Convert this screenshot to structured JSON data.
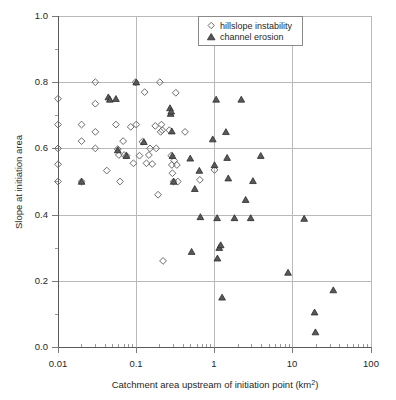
{
  "chart_data": {
    "type": "scatter",
    "title": "",
    "xlabel": "Catchment area upstream of initiation point (km2)",
    "xlabel_main": "Catchment area upstream of initiation point (km",
    "xlabel_sup": "2",
    "xlabel_tail": ")",
    "ylabel": "Slope at initiation area",
    "xscale": "log",
    "yscale": "linear",
    "xlim": [
      0.01,
      100
    ],
    "ylim": [
      0.0,
      1.0
    ],
    "xticks": [
      0.01,
      0.1,
      1,
      10,
      100
    ],
    "xticklabels": [
      "0.01",
      "0.1",
      "1",
      "10",
      "100"
    ],
    "yticks": [
      0.0,
      0.2,
      0.4,
      0.6,
      0.8,
      1.0
    ],
    "yticklabels": [
      "0.0",
      "0.2",
      "0.4",
      "0.6",
      "0.8",
      "1.0"
    ],
    "yticks_minor": [
      0.1,
      0.3,
      0.5,
      0.7,
      0.9
    ],
    "grid": true,
    "grid_color": "#b9b9b9",
    "legend_position": "top-center",
    "series": [
      {
        "name": "hillslope instability",
        "marker": "diamond",
        "color": "#6b6b6b",
        "points": [
          [
            0.01,
            0.75
          ],
          [
            0.01,
            0.672
          ],
          [
            0.01,
            0.6
          ],
          [
            0.01,
            0.552
          ],
          [
            0.01,
            0.5
          ],
          [
            0.02,
            0.672
          ],
          [
            0.02,
            0.622
          ],
          [
            0.02,
            0.5
          ],
          [
            0.03,
            0.8
          ],
          [
            0.03,
            0.735
          ],
          [
            0.03,
            0.65
          ],
          [
            0.03,
            0.6
          ],
          [
            0.042,
            0.533
          ],
          [
            0.055,
            0.672
          ],
          [
            0.058,
            0.598
          ],
          [
            0.06,
            0.58
          ],
          [
            0.062,
            0.5
          ],
          [
            0.068,
            0.622
          ],
          [
            0.07,
            0.58
          ],
          [
            0.075,
            0.578
          ],
          [
            0.085,
            0.665
          ],
          [
            0.092,
            0.555
          ],
          [
            0.098,
            0.8
          ],
          [
            0.1,
            0.672
          ],
          [
            0.11,
            0.578
          ],
          [
            0.12,
            0.62
          ],
          [
            0.128,
            0.77
          ],
          [
            0.135,
            0.555
          ],
          [
            0.145,
            0.58
          ],
          [
            0.15,
            0.6
          ],
          [
            0.16,
            0.553
          ],
          [
            0.175,
            0.668
          ],
          [
            0.18,
            0.6
          ],
          [
            0.19,
            0.46
          ],
          [
            0.2,
            0.8
          ],
          [
            0.205,
            0.65
          ],
          [
            0.21,
            0.672
          ],
          [
            0.215,
            0.655
          ],
          [
            0.22,
            0.26
          ],
          [
            0.265,
            0.655
          ],
          [
            0.28,
            0.578
          ],
          [
            0.285,
            0.55
          ],
          [
            0.29,
            0.525
          ],
          [
            0.3,
            0.5
          ],
          [
            0.305,
            0.563
          ],
          [
            0.32,
            0.768
          ],
          [
            0.33,
            0.55
          ],
          [
            0.34,
            0.5
          ],
          [
            0.42,
            0.65
          ],
          [
            0.65,
            0.505
          ],
          [
            1.0,
            0.535
          ]
        ]
      },
      {
        "name": "channel erosion",
        "marker": "triangle",
        "color": "#58595b",
        "points": [
          [
            0.02,
            0.5
          ],
          [
            0.044,
            0.755
          ],
          [
            0.046,
            0.748
          ],
          [
            0.055,
            0.75
          ],
          [
            0.058,
            0.595
          ],
          [
            0.075,
            0.578
          ],
          [
            0.1,
            0.8
          ],
          [
            0.125,
            0.62
          ],
          [
            0.27,
            0.722
          ],
          [
            0.275,
            0.705
          ],
          [
            0.28,
            0.712
          ],
          [
            0.285,
            0.652
          ],
          [
            0.29,
            0.578
          ],
          [
            0.3,
            0.5
          ],
          [
            0.49,
            0.57
          ],
          [
            0.51,
            0.288
          ],
          [
            0.56,
            0.478
          ],
          [
            0.64,
            0.533
          ],
          [
            0.66,
            0.393
          ],
          [
            0.95,
            0.628
          ],
          [
            1.0,
            0.55
          ],
          [
            1.05,
            0.748
          ],
          [
            1.08,
            0.39
          ],
          [
            1.09,
            0.268
          ],
          [
            1.15,
            0.3
          ],
          [
            1.2,
            0.308
          ],
          [
            1.25,
            0.15
          ],
          [
            1.4,
            0.65
          ],
          [
            1.45,
            0.572
          ],
          [
            1.5,
            0.51
          ],
          [
            1.8,
            0.39
          ],
          [
            2.2,
            0.748
          ],
          [
            2.5,
            0.445
          ],
          [
            2.9,
            0.39
          ],
          [
            3.1,
            0.502
          ],
          [
            3.9,
            0.578
          ],
          [
            8.7,
            0.225
          ],
          [
            14.0,
            0.388
          ],
          [
            19.0,
            0.105
          ],
          [
            19.5,
            0.045
          ],
          [
            33.0,
            0.172
          ]
        ]
      }
    ]
  },
  "legend": {
    "entries": [
      {
        "label": "hillslope instability",
        "marker": "diamond-icon"
      },
      {
        "label": "channel erosion",
        "marker": "triangle-icon"
      }
    ]
  },
  "axes": {
    "x_title": "Catchment area upstream of initiation point (km",
    "x_title_sup": "2",
    "x_title_end": ")",
    "y_title": "Slope at initiation area"
  }
}
